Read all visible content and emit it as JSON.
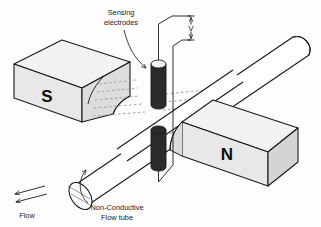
{
  "diagram": {
    "type": "technical-illustration",
    "background_color": "#fdfdfd",
    "line_color": "#1a1a1a",
    "magnet_fill": "#e8e8e8",
    "magnet_top_fill": "#f2f2f2",
    "magnet_side_fill": "#d8d8d8",
    "electrode_fill": "#2b2b2b",
    "electrode_cap_fill": "#f4f4f4",
    "tube_fill": "#ffffff",
    "field_line_color": "#9a9a9a"
  },
  "labels": {
    "sensing_electrodes_line1": "Sensing",
    "sensing_electrodes_line2": "electrodes",
    "voltage": "V",
    "flow": "Flow",
    "flow_tube_line1": "Non-Conductive",
    "flow_tube_line2": "Flow tube",
    "south_pole": "S",
    "north_pole": "N"
  },
  "components": {
    "south_magnet": {
      "name": "South pole magnet",
      "letter": "S",
      "position": "left"
    },
    "north_magnet": {
      "name": "North pole magnet",
      "letter": "N",
      "position": "right"
    },
    "upper_electrode": {
      "name": "Upper sensing electrode",
      "shape": "cylinder"
    },
    "lower_electrode": {
      "name": "Lower sensing electrode",
      "shape": "cylinder"
    },
    "flow_tube": {
      "name": "Non-conductive flow tube",
      "shape": "cylinder",
      "orientation": "diagonal"
    },
    "voltage_measurement": {
      "name": "Induced voltage V",
      "symbol": "V"
    }
  }
}
